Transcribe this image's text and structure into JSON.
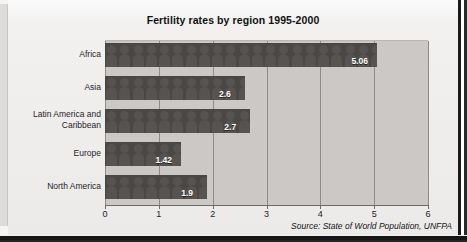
{
  "figure": {
    "title": "Fertility rates by region 1995-2000",
    "source_note": "Source: State of World Population, UNFPA"
  },
  "chart_data": {
    "type": "bar",
    "orientation": "horizontal",
    "style": "pictogram-bar",
    "title": "Fertility rates by region 1995-2000",
    "subtitle": "",
    "xlabel": "",
    "ylabel": "",
    "xlim": [
      0,
      6
    ],
    "ylim": null,
    "xticks": [
      "0",
      "1",
      "2",
      "3",
      "4",
      "5",
      "6"
    ],
    "grid": true,
    "grid_axis": "x",
    "legend": false,
    "legend_position": "none",
    "categories": [
      "Africa",
      "Asia",
      "Latin America and Caribbean",
      "Europe",
      "North America"
    ],
    "values": [
      5.06,
      2.6,
      2.7,
      1.42,
      1.9
    ],
    "value_labels": [
      "5.06",
      "2.6",
      "2.7",
      "1.42",
      "1.9"
    ],
    "annotations": [
      "Source: State of World Population, UNFPA"
    ],
    "colors": {
      "bar": "#4a4745",
      "pictogram": "#565351",
      "plot_background": "#cbc8c6",
      "gridline": "#8e8b89",
      "value_label_text": "#ffffff",
      "axis_text": "#1b1b1b",
      "page_background": "#eceae9"
    }
  },
  "axis": {
    "ticks": [
      {
        "label": "0",
        "value": 0
      },
      {
        "label": "1",
        "value": 1
      },
      {
        "label": "2",
        "value": 2
      },
      {
        "label": "3",
        "value": 3
      },
      {
        "label": "4",
        "value": 4
      },
      {
        "label": "5",
        "value": 5
      },
      {
        "label": "6",
        "value": 6
      }
    ]
  },
  "rows": [
    {
      "label": "Africa",
      "label_line1": "Africa",
      "label_line2": "",
      "value": 5.06,
      "value_label": "5.06"
    },
    {
      "label": "Asia",
      "label_line1": "Asia",
      "label_line2": "",
      "value": 2.6,
      "value_label": "2.6"
    },
    {
      "label": "Latin America and Caribbean",
      "label_line1": "Latin America and",
      "label_line2": "Caribbean",
      "value": 2.7,
      "value_label": "2.7"
    },
    {
      "label": "Europe",
      "label_line1": "Europe",
      "label_line2": "",
      "value": 1.42,
      "value_label": "1.42"
    },
    {
      "label": "North America",
      "label_line1": "North America",
      "label_line2": "",
      "value": 1.9,
      "value_label": "1.9"
    }
  ]
}
